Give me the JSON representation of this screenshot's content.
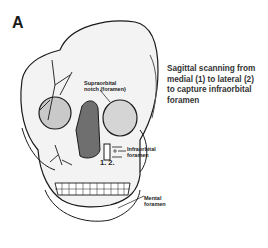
{
  "panel": {
    "letter": "A"
  },
  "caption": {
    "lines": [
      "Sagittal scanning from",
      "medial (1) to lateral (2)",
      " to capture infraorbital",
      "foramen"
    ]
  },
  "labels": {
    "supraorbital_line1": "Supraorbital",
    "supraorbital_line2": "notch (foramen)",
    "infraorbital_line1": "Infraorbital",
    "infraorbital_line2": "foramen",
    "mental_line1": "Mental",
    "mental_line2": "foramen",
    "positions": "1.  2."
  },
  "colors": {
    "line": "#1a1a1a",
    "fill": "#f3f3f3",
    "shade": "#8a8a8a"
  }
}
